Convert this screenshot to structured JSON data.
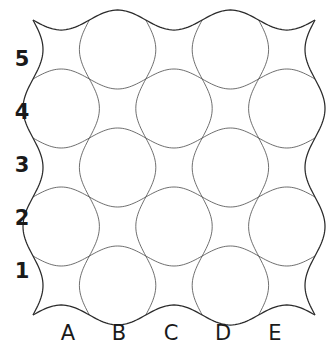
{
  "figure": {
    "title": "",
    "background_color": "#ffffff",
    "line_color": "#555555",
    "border_color": "#2b2b2b",
    "label_color": "#1a1a1a"
  },
  "chart_data": {
    "type": "table",
    "title": "",
    "xlabel": "",
    "ylabel": "",
    "grid": {
      "rows": 5,
      "columns": 5,
      "cells_total": 25,
      "wave_amplitude_px": 10,
      "cell_width_px": 51,
      "cell_height_px": 53
    },
    "row_labels": [
      "5",
      "4",
      "3",
      "2",
      "1"
    ],
    "row_label_positions_y": [
      60,
      113,
      166,
      219,
      272
    ],
    "column_labels": [
      "A",
      "B",
      "C",
      "D",
      "E"
    ],
    "column_label_positions_x": [
      68,
      119,
      171,
      223,
      275
    ],
    "axis_ranges": {
      "x_px": [
        33,
        315
      ],
      "y_px": [
        20,
        315
      ]
    },
    "grid_on": true,
    "legend_position": "none"
  },
  "labels": {
    "rows": [
      {
        "text": "5",
        "y": 60
      },
      {
        "text": "4",
        "y": 113
      },
      {
        "text": "3",
        "y": 166
      },
      {
        "text": "2",
        "y": 219
      },
      {
        "text": "1",
        "y": 272
      }
    ],
    "columns": [
      {
        "text": "A",
        "x": 68
      },
      {
        "text": "B",
        "x": 119
      },
      {
        "text": "C",
        "x": 171
      },
      {
        "text": "D",
        "x": 223
      },
      {
        "text": "E",
        "x": 275
      }
    ],
    "row_label_x": 22,
    "column_label_y": 334
  }
}
